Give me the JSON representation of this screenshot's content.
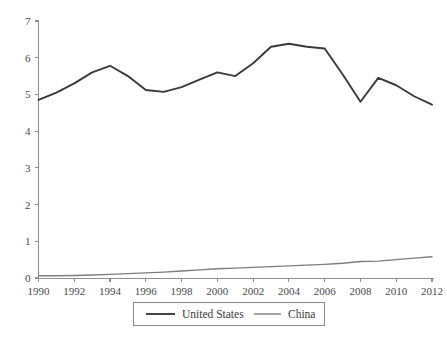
{
  "chart_data": {
    "type": "line",
    "title": "",
    "subtitle": "",
    "xlabel": "",
    "ylabel": "",
    "grid": false,
    "legend_position": "bottom",
    "x": [
      1990,
      1991,
      1992,
      1993,
      1994,
      1995,
      1996,
      1997,
      1998,
      1999,
      2000,
      2001,
      2002,
      2003,
      2004,
      2005,
      2006,
      2007,
      2008,
      2009,
      2010,
      2011,
      2012
    ],
    "xlim": [
      1990,
      2012
    ],
    "ylim": [
      0,
      7
    ],
    "xticks": [
      1990,
      1992,
      1994,
      1996,
      1998,
      2000,
      2002,
      2004,
      2006,
      2008,
      2010,
      2012
    ],
    "xticklabels": [
      "1990",
      "1992",
      "1994",
      "1996",
      "1998",
      "2000",
      "2002",
      "2004",
      "2006",
      "2008",
      "2010",
      "2012"
    ],
    "yticks": [
      0,
      1,
      2,
      3,
      4,
      5,
      6,
      7
    ],
    "yticklabels": [
      "0",
      "1",
      "2",
      "3",
      "4",
      "5",
      "6",
      "7"
    ],
    "series": [
      {
        "name": "United States",
        "color": "#3a3a3a",
        "values": [
          4.85,
          5.05,
          5.3,
          5.6,
          5.78,
          5.5,
          5.12,
          5.07,
          5.2,
          5.4,
          5.6,
          5.5,
          5.85,
          6.3,
          6.38,
          6.3,
          6.25,
          5.55,
          4.8,
          5.45,
          5.25,
          4.95,
          4.72
        ]
      },
      {
        "name": "China",
        "color": "#7e7e7e",
        "values": [
          0.06,
          0.06,
          0.07,
          0.08,
          0.1,
          0.12,
          0.14,
          0.16,
          0.19,
          0.22,
          0.25,
          0.27,
          0.29,
          0.31,
          0.33,
          0.35,
          0.37,
          0.4,
          0.45,
          0.46,
          0.5,
          0.54,
          0.58
        ]
      }
    ],
    "legend": [
      {
        "label": "United States",
        "color": "#3a3a3a"
      },
      {
        "label": "China",
        "color": "#7e7e7e"
      }
    ]
  },
  "axes": {
    "y_tick_labels": [
      "7",
      "6",
      "5",
      "4",
      "3",
      "2",
      "1",
      "0"
    ],
    "x_tick_labels": [
      "1990",
      "1992",
      "1994",
      "1996",
      "1998",
      "2000",
      "2002",
      "2004",
      "2006",
      "2008",
      "2010",
      "2012"
    ]
  },
  "legend": {
    "series_one_label": "United States",
    "series_two_label": "China"
  },
  "colors": {
    "united_states_line": "#3a3a3a",
    "china_line": "#7e7e7e",
    "axis": "#8d8d8d",
    "background": "#ffffff"
  }
}
